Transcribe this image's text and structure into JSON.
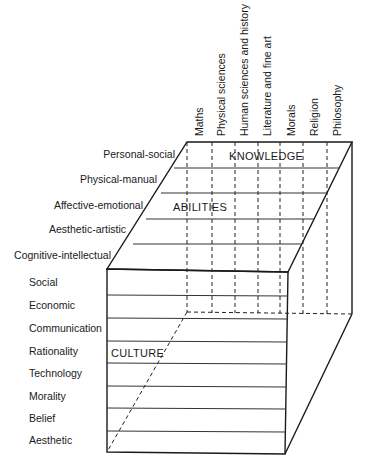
{
  "diagram": {
    "type": "three-dimensional cube model",
    "dimensions": {
      "knowledge": {
        "label": "KNOWLEDGE",
        "items": [
          "Maths",
          "Physical sciences",
          "Human sciences and history",
          "Literature and fine art",
          "Morals",
          "Religion",
          "Philosophy"
        ]
      },
      "abilities": {
        "label": "ABILITIES",
        "items": [
          "Personal-social",
          "Physical-manual",
          "Affective-emotional",
          "Aesthetic-artistic",
          "Cognitive-intellectual"
        ]
      },
      "culture": {
        "label": "CULTURE",
        "items": [
          "Social",
          "Economic",
          "Communication",
          "Rationality",
          "Technology",
          "Morality",
          "Belief",
          "Aesthetic"
        ]
      }
    }
  }
}
